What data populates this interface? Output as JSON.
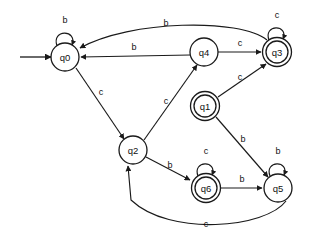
{
  "diagram": {
    "kind": "finite-state-automaton",
    "canvas": {
      "width": 312,
      "height": 243
    },
    "colors": {
      "stroke": "#1a1a1a",
      "fill": "#ffffff",
      "text": "#111111",
      "background": "#ffffff"
    },
    "alphabet": [
      "b",
      "c"
    ],
    "start_state": "q0",
    "accepting_states": [
      "q1",
      "q3",
      "q6"
    ],
    "states": [
      {
        "id": "q0",
        "label": "q0",
        "cx": 65,
        "cy": 57,
        "r": 14,
        "accepting": false,
        "start": true
      },
      {
        "id": "q4",
        "label": "q4",
        "cx": 204,
        "cy": 52,
        "r": 14,
        "accepting": false,
        "start": false
      },
      {
        "id": "q3",
        "label": "q3",
        "cx": 277,
        "cy": 52,
        "r": 14,
        "accepting": true,
        "start": false
      },
      {
        "id": "q1",
        "label": "q1",
        "cx": 205,
        "cy": 106,
        "r": 14,
        "accepting": true,
        "start": false
      },
      {
        "id": "q2",
        "label": "q2",
        "cx": 133,
        "cy": 150,
        "r": 14,
        "accepting": false,
        "start": false
      },
      {
        "id": "q6",
        "label": "q6",
        "cx": 206,
        "cy": 188,
        "r": 14,
        "accepting": true,
        "start": false
      },
      {
        "id": "q5",
        "label": "q5",
        "cx": 278,
        "cy": 188,
        "r": 14,
        "accepting": false,
        "start": false
      }
    ],
    "transitions": [
      {
        "from": "q0",
        "to": "q0",
        "label": "b",
        "kind": "self-loop",
        "label_x": 65,
        "label_y": 21
      },
      {
        "from": "q3",
        "to": "q3",
        "label": "c",
        "kind": "self-loop",
        "label_x": 277,
        "label_y": 16
      },
      {
        "from": "q5",
        "to": "q5",
        "label": "b",
        "kind": "self-loop",
        "label_x": 278,
        "label_y": 152
      },
      {
        "from": "q6",
        "to": "q6",
        "label": "c",
        "kind": "self-loop",
        "label_x": 206,
        "label_y": 152
      },
      {
        "from": "q3",
        "to": "q0",
        "label": "b",
        "kind": "curve",
        "label_x": 166,
        "label_y": 24
      },
      {
        "from": "q4",
        "to": "q0",
        "label": "b",
        "kind": "straight",
        "label_x": 134,
        "label_y": 48
      },
      {
        "from": "q0",
        "to": "q2",
        "label": "c",
        "kind": "straight",
        "label_x": 101,
        "label_y": 93
      },
      {
        "from": "q2",
        "to": "q4",
        "label": "c",
        "kind": "straight",
        "label_x": 166,
        "label_y": 102
      },
      {
        "from": "q4",
        "to": "q3",
        "label": "c",
        "kind": "straight",
        "label_x": 240,
        "label_y": 44
      },
      {
        "from": "q1",
        "to": "q3",
        "label": "c",
        "kind": "straight",
        "label_x": 240,
        "label_y": 78
      },
      {
        "from": "q1",
        "to": "q5",
        "label": "b",
        "kind": "straight",
        "label_x": 243,
        "label_y": 140
      },
      {
        "from": "q2",
        "to": "q6",
        "label": "b",
        "kind": "straight",
        "label_x": 170,
        "label_y": 166
      },
      {
        "from": "q6",
        "to": "q5",
        "label": "b",
        "kind": "straight",
        "label_x": 242,
        "label_y": 180
      },
      {
        "from": "q5",
        "to": "q2",
        "label": "c",
        "kind": "curve",
        "label_x": 206,
        "label_y": 225
      }
    ],
    "start_marker": {
      "x1": 20,
      "y1": 57,
      "x2": 51,
      "y2": 57
    }
  }
}
